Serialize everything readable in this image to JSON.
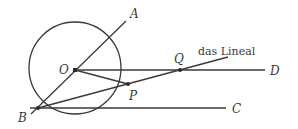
{
  "diagram": {
    "stroke_color": "#3a3a3a",
    "background": "#ffffff",
    "circle": {
      "cx": 75,
      "cy": 68,
      "r": 46
    },
    "points": {
      "O": {
        "label": "O",
        "x": 75,
        "y": 70
      },
      "A": {
        "label": "A",
        "x": 126,
        "y": 21
      },
      "B": {
        "label": "B",
        "x": 38,
        "y": 108
      },
      "P": {
        "label": "P",
        "x": 128,
        "y": 84
      },
      "Q": {
        "label": "Q",
        "x": 180,
        "y": 70
      },
      "C": {
        "label": "C",
        "x": 226,
        "y": 108
      },
      "D": {
        "label": "D",
        "x": 265,
        "y": 70
      }
    },
    "ruler_label": "das Lineal"
  }
}
